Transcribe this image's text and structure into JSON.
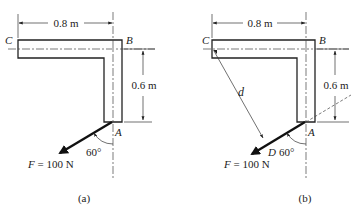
{
  "figure": {
    "panels": [
      {
        "id": "a",
        "caption": "(a)",
        "points": {
          "C": "C",
          "B": "B",
          "A": "A"
        },
        "dimensions": {
          "horizontal": "0.8 m",
          "vertical": "0.6 m"
        },
        "force": {
          "label_var": "F",
          "label_rest": " = 100 N"
        },
        "angle": "60°"
      },
      {
        "id": "b",
        "caption": "(b)",
        "points": {
          "C": "C",
          "B": "B",
          "A": "A",
          "D": "D"
        },
        "dimensions": {
          "horizontal": "0.8 m",
          "vertical": "0.6 m",
          "perpendicular": "d"
        },
        "force": {
          "label_var": "F",
          "label_rest": " = 100 N"
        },
        "angle": "60°"
      }
    ]
  }
}
